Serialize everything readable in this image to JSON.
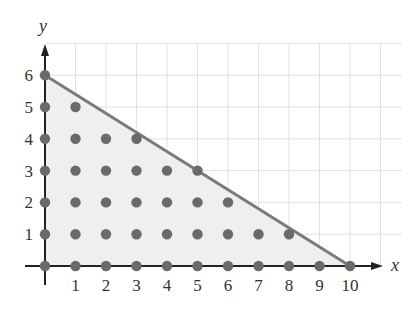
{
  "chart_data": {
    "type": "scatter",
    "title": "",
    "xlabel": "x",
    "ylabel": "y",
    "xlim": [
      0,
      11
    ],
    "ylim": [
      0,
      7
    ],
    "grid": true,
    "x_ticks": [
      1,
      2,
      3,
      4,
      5,
      6,
      7,
      8,
      9,
      10
    ],
    "y_ticks": [
      1,
      2,
      3,
      4,
      5,
      6
    ],
    "boundary_line": {
      "from": [
        0,
        6
      ],
      "to": [
        10,
        0
      ],
      "equation": "3x + 5y = 30"
    },
    "shaded_region": [
      [
        0,
        0
      ],
      [
        0,
        6
      ],
      [
        10,
        0
      ]
    ],
    "points": [
      [
        0,
        0
      ],
      [
        1,
        0
      ],
      [
        2,
        0
      ],
      [
        3,
        0
      ],
      [
        4,
        0
      ],
      [
        5,
        0
      ],
      [
        6,
        0
      ],
      [
        7,
        0
      ],
      [
        8,
        0
      ],
      [
        9,
        0
      ],
      [
        10,
        0
      ],
      [
        0,
        1
      ],
      [
        1,
        1
      ],
      [
        2,
        1
      ],
      [
        3,
        1
      ],
      [
        4,
        1
      ],
      [
        5,
        1
      ],
      [
        6,
        1
      ],
      [
        7,
        1
      ],
      [
        8,
        1
      ],
      [
        0,
        2
      ],
      [
        1,
        2
      ],
      [
        2,
        2
      ],
      [
        3,
        2
      ],
      [
        4,
        2
      ],
      [
        5,
        2
      ],
      [
        6,
        2
      ],
      [
        0,
        3
      ],
      [
        1,
        3
      ],
      [
        2,
        3
      ],
      [
        3,
        3
      ],
      [
        4,
        3
      ],
      [
        5,
        3
      ],
      [
        0,
        4
      ],
      [
        1,
        4
      ],
      [
        2,
        4
      ],
      [
        3,
        4
      ],
      [
        0,
        5
      ],
      [
        1,
        5
      ],
      [
        0,
        6
      ]
    ]
  },
  "labels": {
    "x_axis": "x",
    "y_axis": "y",
    "x_ticks": [
      "1",
      "2",
      "3",
      "4",
      "5",
      "6",
      "7",
      "8",
      "9",
      "10"
    ],
    "y_ticks": [
      "1",
      "2",
      "3",
      "4",
      "5",
      "6"
    ]
  },
  "colors": {
    "grid": "#e2e2e2",
    "fill": "#efefef",
    "line": "#7a7a7a",
    "point": "#6a6a6a",
    "axis": "#222222"
  }
}
